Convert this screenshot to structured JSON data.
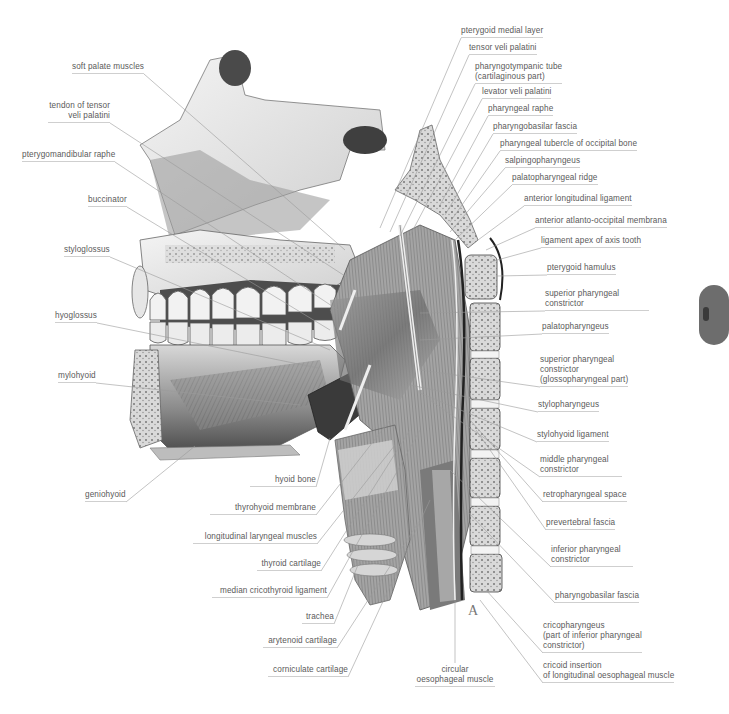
{
  "figure": {
    "corner_letter": "A",
    "labels_left": [
      {
        "id": "soft-palate-muscles",
        "lines": [
          "soft palate muscles"
        ],
        "x": 72,
        "y": 62,
        "align": "left",
        "to": [
          345,
          250
        ]
      },
      {
        "id": "tendon-tensor-veli-palatini",
        "lines": [
          "tendon of tensor",
          "veli palatini"
        ],
        "x": 48,
        "y": 101,
        "align": "right",
        "w": 62,
        "to": [
          348,
          278
        ]
      },
      {
        "id": "pterygomandibular-raphe",
        "lines": [
          "pterygomandibular raphe"
        ],
        "x": 22,
        "y": 150,
        "align": "left",
        "to": [
          338,
          310
        ]
      },
      {
        "id": "buccinator",
        "lines": [
          "buccinator"
        ],
        "x": 88,
        "y": 195,
        "align": "left",
        "to": [
          330,
          330
        ]
      },
      {
        "id": "styloglossus",
        "lines": [
          "styloglossus"
        ],
        "x": 64,
        "y": 245,
        "align": "left",
        "to": [
          330,
          350
        ]
      },
      {
        "id": "hyoglossus",
        "lines": [
          "hyoglossus"
        ],
        "x": 55,
        "y": 311,
        "align": "left",
        "to": [
          318,
          368
        ]
      },
      {
        "id": "mylohyoid",
        "lines": [
          "mylohyoid"
        ],
        "x": 58,
        "y": 371,
        "align": "left",
        "to": [
          300,
          405
        ]
      },
      {
        "id": "geniohyoid",
        "lines": [
          "geniohyoid"
        ],
        "x": 85,
        "y": 490,
        "align": "left",
        "to": [
          195,
          446
        ]
      }
    ],
    "labels_bottom": [
      {
        "id": "hyoid-bone",
        "lines": [
          "hyoid bone"
        ],
        "x": 250,
        "y": 475,
        "align": "right",
        "w": 66,
        "to": [
          330,
          438
        ]
      },
      {
        "id": "thyrohyoid-membrane",
        "lines": [
          "thyrohyoid membrane"
        ],
        "x": 210,
        "y": 503,
        "align": "right",
        "w": 106,
        "to": [
          390,
          420
        ]
      },
      {
        "id": "longitudinal-laryngeal-muscles",
        "lines": [
          "longitudinal laryngeal muscles"
        ],
        "x": 193,
        "y": 532,
        "align": "right",
        "w": 124,
        "to": [
          395,
          445
        ]
      },
      {
        "id": "thyroid-cartilage",
        "lines": [
          "thyroid cartilage"
        ],
        "x": 257,
        "y": 559,
        "align": "right",
        "w": 64,
        "to": [
          410,
          430
        ]
      },
      {
        "id": "median-cricothyroid-ligament",
        "lines": [
          "median cricothyroid ligament"
        ],
        "x": 212,
        "y": 586,
        "align": "right",
        "w": 115,
        "to": [
          420,
          430
        ]
      },
      {
        "id": "trachea",
        "lines": [
          "trachea"
        ],
        "x": 302,
        "y": 612,
        "align": "right",
        "w": 32,
        "to": [
          360,
          560
        ]
      },
      {
        "id": "arytenoid-cartilage",
        "lines": [
          "arytenoid cartilage"
        ],
        "x": 263,
        "y": 636,
        "align": "right",
        "w": 74,
        "to": [
          420,
          520
        ]
      },
      {
        "id": "corniculate-cartilage",
        "lines": [
          "corniculate cartilage"
        ],
        "x": 268,
        "y": 665,
        "align": "right",
        "w": 80,
        "to": [
          430,
          500
        ]
      },
      {
        "id": "circular-oesophageal-muscle",
        "lines": [
          "circular",
          "oesophageal muscle"
        ],
        "x": 415,
        "y": 665,
        "align": "center",
        "w": 80,
        "to": [
          455,
          600
        ]
      }
    ],
    "labels_right": [
      {
        "id": "pterygoid-medial-layer",
        "lines": [
          "pterygoid medial layer"
        ],
        "x": 461,
        "y": 26,
        "align": "left",
        "to": [
          380,
          228
        ]
      },
      {
        "id": "tensor-veli-palatini",
        "lines": [
          "tensor veli palatini"
        ],
        "x": 469,
        "y": 43,
        "align": "left",
        "to": [
          390,
          232
        ]
      },
      {
        "id": "pharyngotympanic-tube",
        "lines": [
          "pharyngotympanic tube",
          "(cartilaginous part)"
        ],
        "x": 475,
        "y": 62,
        "align": "left",
        "to": [
          400,
          236
        ]
      },
      {
        "id": "levator-veli-palatini",
        "lines": [
          "levator veli palatini"
        ],
        "x": 482,
        "y": 87,
        "align": "left",
        "to": [
          405,
          245
        ]
      },
      {
        "id": "pharyngeal-raphe",
        "lines": [
          "pharyngeal raphe"
        ],
        "x": 488,
        "y": 104,
        "align": "left",
        "to": [
          440,
          205
        ]
      },
      {
        "id": "pharyngobasilar-fascia-top",
        "lines": [
          "pharyngobasilar fascia"
        ],
        "x": 493,
        "y": 122,
        "align": "left",
        "to": [
          445,
          215
        ]
      },
      {
        "id": "pharyngeal-tubercle-occipital-bone",
        "lines": [
          "pharyngeal tubercle of occipital bone"
        ],
        "x": 500,
        "y": 139,
        "align": "left",
        "to": [
          450,
          222
        ]
      },
      {
        "id": "salpingopharyngeus",
        "lines": [
          "salpingopharyngeus"
        ],
        "x": 505,
        "y": 156,
        "align": "left",
        "to": [
          450,
          232
        ]
      },
      {
        "id": "palatopharyngeal-ridge",
        "lines": [
          "palatopharyngeal ridge"
        ],
        "x": 512,
        "y": 173,
        "align": "left",
        "to": [
          455,
          240
        ]
      },
      {
        "id": "anterior-longitudinal-ligament",
        "lines": [
          "anterior longitudinal ligament"
        ],
        "x": 524,
        "y": 194,
        "align": "left",
        "to": [
          478,
          240
        ]
      },
      {
        "id": "anterior-atlanto-occipital-membrana",
        "lines": [
          "anterior atlanto-occipital membrana"
        ],
        "x": 535,
        "y": 216,
        "align": "left",
        "to": [
          486,
          250
        ]
      },
      {
        "id": "ligament-apex-axis-tooth",
        "lines": [
          "ligament apex of axis tooth"
        ],
        "x": 541,
        "y": 236,
        "align": "left",
        "to": [
          490,
          262
        ]
      },
      {
        "id": "pterygoid-hamulus",
        "lines": [
          "pterygoid hamulus"
        ],
        "x": 547,
        "y": 263,
        "align": "left",
        "to": [
          497,
          276
        ]
      },
      {
        "id": "superior-pharyngeal-constrictor",
        "lines": [
          "superior pharyngeal",
          "constrictor"
        ],
        "x": 545,
        "y": 289,
        "align": "left",
        "w": 104,
        "to": [
          420,
          313
        ]
      },
      {
        "id": "palatopharyngeus",
        "lines": [
          "palatopharyngeus"
        ],
        "x": 542,
        "y": 322,
        "align": "left",
        "to": [
          420,
          340
        ]
      },
      {
        "id": "superior-pharyngeal-constrictor-glosso",
        "lines": [
          "superior pharyngeal",
          "constrictor",
          "(glossopharyngeal part)"
        ],
        "x": 540,
        "y": 355,
        "align": "left",
        "to": [
          420,
          370
        ]
      },
      {
        "id": "stylopharyngeus",
        "lines": [
          "stylopharyngeus"
        ],
        "x": 538,
        "y": 400,
        "align": "left",
        "to": [
          410,
          385
        ]
      },
      {
        "id": "stylohyoid-ligament",
        "lines": [
          "stylohyoid ligament"
        ],
        "x": 537,
        "y": 430,
        "align": "left",
        "to": [
          420,
          393
        ]
      },
      {
        "id": "middle-pharyngeal-constrictor",
        "lines": [
          "middle pharyngeal",
          "constrictor"
        ],
        "x": 540,
        "y": 455,
        "align": "left",
        "w": 82,
        "to": [
          430,
          400
        ]
      },
      {
        "id": "retropharyngeal-space",
        "lines": [
          "retropharyngeal space"
        ],
        "x": 543,
        "y": 490,
        "align": "left",
        "to": [
          470,
          420
        ]
      },
      {
        "id": "prevertebral-fascia",
        "lines": [
          "prevertebral fascia"
        ],
        "x": 546,
        "y": 518,
        "align": "left",
        "to": [
          476,
          430
        ]
      },
      {
        "id": "inferior-pharyngeal-constrictor",
        "lines": [
          "inferior pharyngeal",
          "constrictor"
        ],
        "x": 551,
        "y": 545,
        "align": "left",
        "w": 82,
        "to": [
          450,
          470
        ]
      },
      {
        "id": "pharyngobasilar-fascia-bottom",
        "lines": [
          "pharyngobasilar fascia"
        ],
        "x": 555,
        "y": 591,
        "align": "left",
        "to": [
          466,
          510
        ]
      },
      {
        "id": "cricopharyngeus",
        "lines": [
          "cricopharyngeus",
          "(part of inferior pharyngeal",
          "constrictor)"
        ],
        "x": 543,
        "y": 621,
        "align": "left",
        "to": [
          486,
          590
        ]
      },
      {
        "id": "cricoid-insertion-longitudinal-oesophageal-muscle",
        "lines": [
          "cricoid insertion",
          "of longitudinal oesophageal muscle"
        ],
        "x": 543,
        "y": 661,
        "align": "left",
        "to": [
          480,
          600
        ]
      }
    ]
  }
}
